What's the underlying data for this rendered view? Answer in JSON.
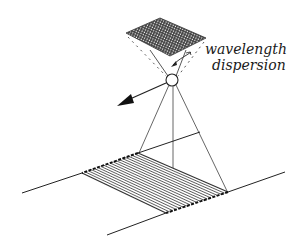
{
  "diagram": {
    "type": "pushbroom imaging spectrometer schematic",
    "labels": {
      "dispersion_line1": "wavelength",
      "dispersion_line2": "dispersion"
    },
    "colors": {
      "ink": "#1a1a1a",
      "grid_fill": "#555555",
      "background": "#ffffff"
    },
    "detector_array": {
      "corners": [
        [
          126,
          33
        ],
        [
          160,
          18
        ],
        [
          206,
          38
        ],
        [
          170,
          56
        ]
      ],
      "grid_divisions": 18
    },
    "lens": {
      "cx": 172,
      "cy": 80,
      "r": 6
    },
    "flight_direction_arrow": {
      "from": [
        166,
        83
      ],
      "to": [
        118,
        105
      ]
    },
    "scan_swath": {
      "corners": [
        [
          138,
          153
        ],
        [
          228,
          192
        ],
        [
          166,
          213
        ],
        [
          82,
          173
        ]
      ],
      "hatch_lines": 18
    },
    "ground_lines": [
      {
        "from": [
          22,
          193
        ],
        "to": [
          82,
          173
        ]
      },
      {
        "from": [
          228,
          192
        ],
        "to": [
          285,
          172
        ]
      },
      {
        "from": [
          107,
          235
        ],
        "to": [
          166,
          213
        ]
      },
      {
        "from": [
          138,
          153
        ],
        "to": [
          200,
          132
        ]
      }
    ]
  }
}
